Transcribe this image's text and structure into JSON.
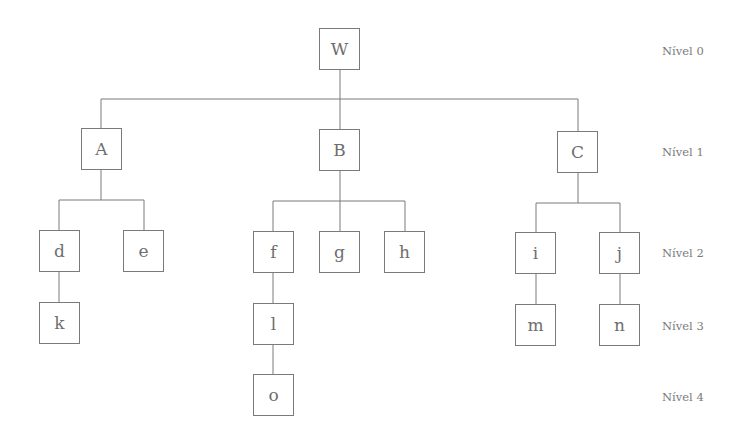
{
  "diagram": {
    "type": "tree",
    "line_color": "#7a7a7a",
    "nodes": {
      "W": {
        "label": "W",
        "level": 0
      },
      "A": {
        "label": "A",
        "level": 1
      },
      "B": {
        "label": "B",
        "level": 1
      },
      "C": {
        "label": "C",
        "level": 1
      },
      "d": {
        "label": "d",
        "level": 2
      },
      "e": {
        "label": "e",
        "level": 2
      },
      "f": {
        "label": "f",
        "level": 2
      },
      "g": {
        "label": "g",
        "level": 2
      },
      "h": {
        "label": "h",
        "level": 2
      },
      "i": {
        "label": "i",
        "level": 2
      },
      "j": {
        "label": "j",
        "level": 2
      },
      "k": {
        "label": "k",
        "level": 3
      },
      "l": {
        "label": "l",
        "level": 3
      },
      "m": {
        "label": "m",
        "level": 3
      },
      "n": {
        "label": "n",
        "level": 3
      },
      "o": {
        "label": "o",
        "level": 4
      }
    },
    "edges": [
      [
        "W",
        "A"
      ],
      [
        "W",
        "B"
      ],
      [
        "W",
        "C"
      ],
      [
        "A",
        "d"
      ],
      [
        "A",
        "e"
      ],
      [
        "B",
        "f"
      ],
      [
        "B",
        "g"
      ],
      [
        "B",
        "h"
      ],
      [
        "C",
        "i"
      ],
      [
        "C",
        "j"
      ],
      [
        "d",
        "k"
      ],
      [
        "f",
        "l"
      ],
      [
        "l",
        "o"
      ],
      [
        "i",
        "m"
      ],
      [
        "j",
        "n"
      ]
    ],
    "levels": [
      "Nível 0",
      "Nível 1",
      "Nível 2",
      "Nível 3",
      "Nível 4"
    ]
  }
}
